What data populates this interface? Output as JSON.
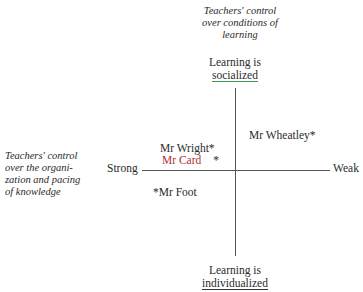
{
  "captions": {
    "vertical_axis": [
      "Teachers' control",
      "over conditions of",
      "learning"
    ],
    "horizontal_axis": [
      "Teachers' control",
      "over the organi-",
      "zation and pacing",
      "of knowledge"
    ]
  },
  "poles": {
    "top_line1": "Learning is",
    "top_line2": "socialized",
    "bottom_line1": "Learning is",
    "bottom_line2": "individualized",
    "left": "Strong",
    "right": "Weak"
  },
  "points": [
    {
      "label": "Mr Wright",
      "marker": "*",
      "quadrant": "upper-left"
    },
    {
      "label": "Mr Card",
      "marker": "*",
      "quadrant": "upper-left"
    },
    {
      "label": "Mr Wheatley",
      "marker": "*",
      "quadrant": "upper-right"
    },
    {
      "label": "Mr Foot",
      "marker": "*",
      "quadrant": "lower-left"
    }
  ],
  "colors": {
    "axis": "#555555",
    "socialized_underline": "#3a9a50",
    "card_label": "#b03030"
  }
}
